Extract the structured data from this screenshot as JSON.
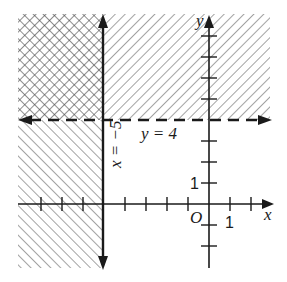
{
  "figure": {
    "type": "graph of system of linear inequalities",
    "regions": [
      {
        "name": "x <= -5",
        "pattern": "diagonal-hatch-backslash",
        "description": "shaded left of x = -5"
      },
      {
        "name": "y >= 4",
        "pattern": "diagonal-hatch-slash",
        "description": "shaded above y = 4"
      },
      {
        "name": "solution",
        "pattern": "cross-hatch",
        "description": "overlap region x <= -5 and y >= 4"
      }
    ],
    "boundaries": [
      {
        "equation": "x = −5",
        "style": "solid",
        "label": "x = −5"
      },
      {
        "equation": "y = 4",
        "style": "dashed",
        "label": "y = 4"
      }
    ]
  },
  "labels": {
    "x_axis": "x",
    "y_axis": "y",
    "origin": "O",
    "x_unit": "1",
    "y_unit": "1",
    "line_x": "x = −5",
    "line_y": "y = 4"
  },
  "colors": {
    "ink": "#1a1a1a",
    "hatch": "#555555",
    "background": "#ffffff"
  }
}
